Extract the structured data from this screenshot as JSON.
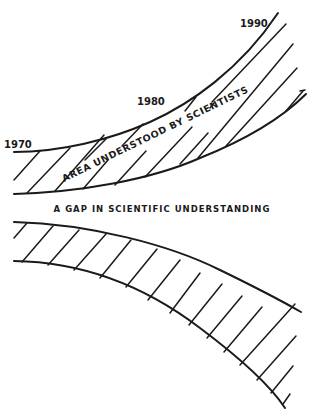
{
  "diagram": {
    "year_labels": [
      {
        "text": "1970",
        "x": 4,
        "y": 148
      },
      {
        "text": "1980",
        "x": 137,
        "y": 105
      },
      {
        "text": "1990",
        "x": 240,
        "y": 27
      }
    ],
    "band_label": "AREA UNDERSTOOD BY SCIENTISTS",
    "gap_label": "A GAP IN SCIENTIFIC UNDERSTANDING",
    "colors": {
      "ink": "#1a1a1a",
      "background": "#ffffff"
    },
    "top_band": {
      "upper_curve": "M14,152 C60,152 110,140 150,122 C190,104 240,70 278,13",
      "lower_curve": "M14,194 C80,192 150,180 200,158 C240,142 280,120 306,94",
      "hatches": [
        "M14,180 L40,151",
        "M27,193 L70,148",
        "M55,191 L104,135",
        "M83,189 L108,160",
        "M85,160 L106,139",
        "M115,185 L146,151",
        "M122,146 L143,124",
        "M145,177 L192,127",
        "M180,164 L208,133",
        "M185,111 L196,97",
        "M212,102 L286,24",
        "M214,103 L210,108",
        "M198,158 L293,44",
        "M226,146 L297,68",
        "M300,91 L305,90",
        "M286,111 L303,91"
      ]
    },
    "bottom_band": {
      "upper_curve": "M14,222 C90,224 170,245 220,270 C255,287 280,300 301,312",
      "lower_curve": "M14,261 C90,262 150,290 200,328 C240,358 270,385 285,408",
      "hatches": [
        "M14,238 L27,223",
        "M22,262 L53,226",
        "M48,265 L79,230",
        "M74,270 L106,234",
        "M100,278 L131,240",
        "M126,287 L157,249",
        "M148,300 L180,260",
        "M170,313 L200,273",
        "M189,325 L222,284",
        "M207,338 L242,296",
        "M224,352 L262,307",
        "M240,365 L295,304",
        "M257,380 L296,336",
        "M271,393 L293,366",
        "M283,404 L290,394"
      ]
    }
  }
}
